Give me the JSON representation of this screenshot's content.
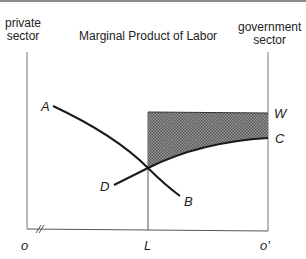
{
  "title": "Marginal Product of Labor",
  "left_axis_label": [
    "private",
    "sector"
  ],
  "right_axis_label": [
    "government",
    "sector"
  ],
  "points": {
    "A": "A",
    "B": "B",
    "C": "C",
    "D": "D",
    "W": "W"
  },
  "x_axis": {
    "origin": "o",
    "L": "L",
    "origin_prime": "o'"
  },
  "colors": {
    "line": "#1a1a1a",
    "axis": "#555555",
    "hatch": "#777777"
  }
}
